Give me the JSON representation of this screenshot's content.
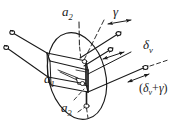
{
  "figure": {
    "kind": "hand-drawn technical line diagram",
    "background_color": "#ffffff",
    "ink_color": "#1a1a1a",
    "width_px": 192,
    "height_px": 129,
    "labels": {
      "axis_a2": {
        "base": "a",
        "sub": "2"
      },
      "axis_a1": {
        "base": "a",
        "sub": "1"
      },
      "axis_a3": {
        "base": "a",
        "sub": "3"
      },
      "angle_gamma": "γ",
      "angle_delta_v": {
        "base": "δ",
        "sub": "v"
      },
      "angle_sum": {
        "open": "(",
        "delta": "δ",
        "delta_sub": "v",
        "plus": "+",
        "gamma": "γ",
        "close": ")",
        "full": "(δv+γ)"
      }
    },
    "annotations": {
      "left_vectors_count": 2,
      "right_vectors_count": 4,
      "double_arrow_markers": 3,
      "circle_terminators": 6
    }
  }
}
